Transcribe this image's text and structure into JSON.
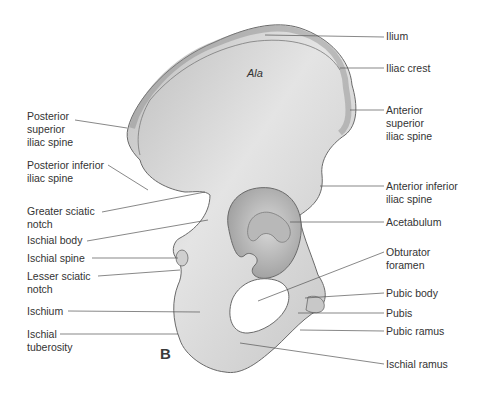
{
  "figure": {
    "panel_letter": "B",
    "region_label": "Ala",
    "colors": {
      "bone_fill": "#cfcfcf",
      "bone_light": "#e6e6e6",
      "bone_dark": "#9a9a9a",
      "outline": "#6a6a6a",
      "leader_line": "#555555",
      "text": "#333333"
    }
  },
  "labels_left": [
    {
      "text": "Posterior\nsuperior\niliac spine",
      "y": 116
    },
    {
      "text": "Posterior inferior\niliac spine",
      "y": 161
    },
    {
      "text": "Greater sciatic\nnotch",
      "y": 207
    },
    {
      "text": "Ischial body",
      "y": 236
    },
    {
      "text": "Ischial spine",
      "y": 253
    },
    {
      "text": "Lesser sciatic\nnotch",
      "y": 271
    },
    {
      "text": "Ischium",
      "y": 305
    },
    {
      "text": "Ischial\ntuberosity",
      "y": 328
    }
  ],
  "labels_right": [
    {
      "text": "Ilium",
      "y": 30
    },
    {
      "text": "Iliac crest",
      "y": 62
    },
    {
      "text": "Anterior\nsuperior\niliac spine",
      "y": 106
    },
    {
      "text": "Anterior inferior\niliac spine",
      "y": 181
    },
    {
      "text": "Acetabulum",
      "y": 216
    },
    {
      "text": "Obturator\nforamen",
      "y": 247
    },
    {
      "text": "Pubic body",
      "y": 288
    },
    {
      "text": "Pubis",
      "y": 307
    },
    {
      "text": "Pubic ramus",
      "y": 326
    },
    {
      "text": "Ischial ramus",
      "y": 359
    }
  ]
}
